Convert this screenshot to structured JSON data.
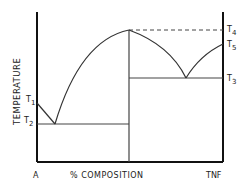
{
  "diagram": {
    "type": "phase-diagram",
    "axes": {
      "ylabel": "TEMPERATURE",
      "xlabel": "% COMPOSITION",
      "x_left_label": "A",
      "x_right_label": "TNF"
    },
    "temperature_labels": {
      "t1": {
        "main": "T",
        "sub": "1"
      },
      "t2": {
        "main": "T",
        "sub": "2"
      },
      "t3": {
        "main": "T",
        "sub": "3"
      },
      "t4": {
        "main": "T",
        "sub": "4"
      },
      "t5": {
        "main": "T",
        "sub": "5"
      }
    },
    "colors": {
      "line": "#333333",
      "axis": "#111111",
      "background": "#ffffff"
    }
  }
}
